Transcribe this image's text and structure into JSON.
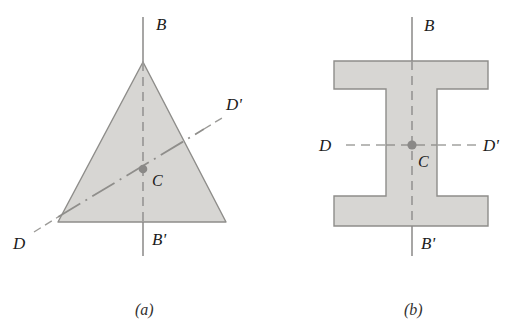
{
  "figure": {
    "background_color": "#ffffff",
    "shape_fill_color": "#d6d5d2",
    "shape_stroke_color": "#8d8c89",
    "axis_color": "#8a8987",
    "center_dot_color": "#8a8987",
    "label_color": "#1c1c1c",
    "panels": [
      {
        "id": "panel-a",
        "caption": "(a)",
        "shape_name": "equilateral-triangle",
        "labels": {
          "axis_b_top": "B",
          "axis_b_bottom": "B'",
          "axis_d_left": "D",
          "axis_d_right": "D'",
          "center": "C"
        },
        "geometry": {
          "apex": [
            143,
            62
          ],
          "bottom_left": [
            58,
            222
          ],
          "bottom_right": [
            226,
            222
          ],
          "centroid": [
            143,
            169
          ],
          "axis_b_line": [
            [
              143,
              17
            ],
            [
              143,
              256
            ]
          ],
          "axis_d_line": [
            [
              34,
              232
            ],
            [
              222,
              118
            ]
          ]
        }
      },
      {
        "id": "panel-b",
        "caption": "(b)",
        "shape_name": "i-beam-section",
        "labels": {
          "axis_b_top": "B",
          "axis_b_bottom": "B'",
          "axis_d_left": "D",
          "axis_d_right": "D'",
          "center": "C"
        },
        "geometry": {
          "outer_left": 334,
          "outer_right": 488,
          "outer_top": 61,
          "outer_bottom": 226,
          "flange_thickness": 28,
          "web_left": 386,
          "web_right": 437,
          "center": [
            412,
            145
          ],
          "axis_b_line": [
            [
              412,
              17
            ],
            [
              412,
              256
            ]
          ],
          "axis_d_line": [
            [
              346,
              145
            ],
            [
              479,
              145
            ]
          ]
        }
      }
    ]
  }
}
